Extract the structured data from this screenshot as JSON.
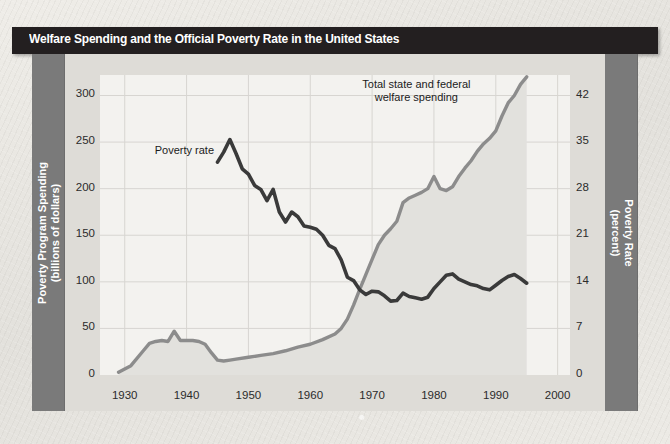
{
  "figure": {
    "title": "Welfare Spending and the Official Poverty Rate in the United States",
    "colors": {
      "title_bar": "#231f20",
      "axis_band": "#7a7a7a",
      "gutter": "#dedcd7",
      "plot_bg": "#f3f2ef",
      "spending_line": "#8c8c8c",
      "spending_fill": "#e2e1dd",
      "poverty_line": "#3a3a3a",
      "grid": "#d7d5d1"
    }
  },
  "annotations": {
    "spending": "Total state and federal\nwelfare spending",
    "poverty": "Poverty rate"
  },
  "chart_data": {
    "type": "line",
    "title": "Welfare Spending and the Official Poverty Rate in the United States",
    "xlabel": "",
    "ylabel": "Poverty Program Spending\n(billions of dollars)",
    "y2label": "Poverty Rate\n(percent)",
    "grid": true,
    "legend": "annotations-inline",
    "xlim": [
      1926,
      2002
    ],
    "xticks": [
      1930,
      1940,
      1950,
      1960,
      1970,
      1980,
      1990,
      2000
    ],
    "ylim": [
      0,
      322
    ],
    "yticks": [
      0,
      50,
      100,
      150,
      200,
      250,
      300
    ],
    "y2lim": [
      0,
      45.1
    ],
    "y2ticks": [
      0,
      7,
      14,
      21,
      28,
      35,
      42
    ],
    "series": [
      {
        "name": "Total state and federal welfare spending",
        "axis": "left",
        "unit": "billions of dollars",
        "color": "#8c8c8c",
        "x": [
          1929,
          1931,
          1933,
          1934,
          1935,
          1936,
          1937,
          1938,
          1939,
          1940,
          1941,
          1942,
          1943,
          1944,
          1945,
          1946,
          1947,
          1948,
          1950,
          1952,
          1954,
          1956,
          1958,
          1960,
          1962,
          1964,
          1965,
          1966,
          1967,
          1968,
          1969,
          1970,
          1971,
          1972,
          1973,
          1974,
          1975,
          1976,
          1977,
          1978,
          1979,
          1980,
          1981,
          1982,
          1983,
          1984,
          1985,
          1986,
          1987,
          1988,
          1989,
          1990,
          1991,
          1992,
          1993,
          1994,
          1995
        ],
        "values": [
          3,
          10,
          26,
          34,
          36,
          37,
          36,
          47,
          37,
          37,
          37,
          36,
          33,
          24,
          16,
          15,
          16,
          17,
          19,
          21,
          23,
          26,
          30,
          33,
          38,
          44,
          50,
          60,
          75,
          92,
          108,
          124,
          140,
          150,
          157,
          165,
          185,
          190,
          193,
          196,
          200,
          213,
          200,
          198,
          202,
          213,
          222,
          230,
          240,
          248,
          254,
          262,
          278,
          292,
          300,
          312,
          320
        ]
      },
      {
        "name": "Poverty rate",
        "axis": "right",
        "unit": "percent",
        "color": "#3a3a3a",
        "x": [
          1945,
          1946,
          1947,
          1948,
          1949,
          1950,
          1951,
          1952,
          1953,
          1954,
          1955,
          1956,
          1957,
          1958,
          1959,
          1960,
          1961,
          1962,
          1963,
          1964,
          1965,
          1966,
          1967,
          1968,
          1969,
          1970,
          1971,
          1972,
          1973,
          1974,
          1975,
          1976,
          1977,
          1978,
          1979,
          1980,
          1981,
          1982,
          1983,
          1984,
          1985,
          1986,
          1987,
          1988,
          1989,
          1990,
          1991,
          1992,
          1993,
          1994,
          1995
        ],
        "values": [
          32.0,
          33.5,
          35.4,
          33.3,
          31.0,
          30.2,
          28.5,
          27.9,
          26.2,
          27.9,
          24.5,
          23.0,
          24.5,
          23.8,
          22.4,
          22.2,
          21.9,
          21.0,
          19.5,
          19.0,
          17.3,
          14.7,
          14.2,
          12.8,
          12.1,
          12.6,
          12.5,
          11.9,
          11.1,
          11.2,
          12.3,
          11.8,
          11.6,
          11.4,
          11.7,
          13.0,
          14.0,
          15.0,
          15.2,
          14.4,
          14.0,
          13.6,
          13.4,
          13.0,
          12.8,
          13.5,
          14.2,
          14.8,
          15.1,
          14.5,
          13.8
        ]
      }
    ]
  }
}
